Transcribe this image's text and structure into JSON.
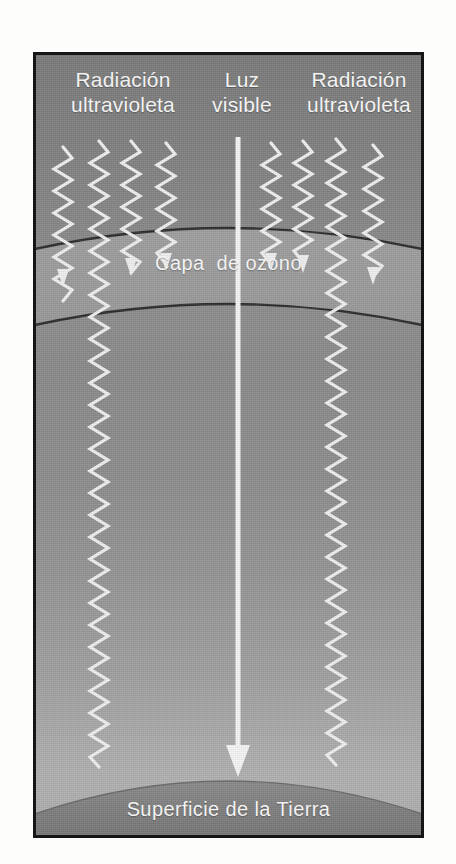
{
  "figure": {
    "language": "es",
    "style": "grayscale halftone print illustration"
  },
  "labels": {
    "uv_left": "Radiación\nultravioleta",
    "visible_light": "Luz\nvisible",
    "uv_right": "Radiación\nultravioleta",
    "ozone_layer": "Capa  de ozono",
    "earth_surface": "Superficie de la Tierra"
  },
  "colors": {
    "frame_border": "#151515",
    "sky_top": "#7a7a7a",
    "sky_mid": "#8a8a8a",
    "sky_lower": "#a8a8a8",
    "ozone_band": "#9a9a9a",
    "ozone_outline": "#2e2e2e",
    "earth_band": "#7d7d7d",
    "ray_white": "#f2f2f2",
    "label_text": "#f2f2f2",
    "page_background": "#fdfdfc"
  },
  "elements": {
    "uv_waves_left": [
      {
        "name": "uv-wave-left-1",
        "x": 27,
        "blocked": true,
        "end_y": 215
      },
      {
        "name": "uv-wave-left-2",
        "x": 63,
        "blocked": false,
        "end_y": 735
      },
      {
        "name": "uv-wave-left-3",
        "x": 95,
        "blocked": true,
        "end_y": 205
      },
      {
        "name": "uv-wave-left-4",
        "x": 130,
        "blocked": true,
        "end_y": 200
      }
    ],
    "uv_waves_right": [
      {
        "name": "uv-wave-right-1",
        "x": 235,
        "blocked": true,
        "end_y": 198
      },
      {
        "name": "uv-wave-right-2",
        "x": 267,
        "blocked": true,
        "end_y": 200
      },
      {
        "name": "uv-wave-right-3",
        "x": 300,
        "blocked": false,
        "end_y": 735
      },
      {
        "name": "uv-wave-right-4",
        "x": 337,
        "blocked": true,
        "end_y": 212
      }
    ],
    "visible_beam": {
      "name": "visible-light-beam",
      "x": 202,
      "start_y": 82,
      "end_y": 718,
      "arrowhead": true,
      "description": "Straight white arrow passing unobstructed through the ozone layer to the Earth's surface"
    },
    "ozone_band": {
      "top_edge_center_y": 162,
      "top_edge_side_y": 196,
      "bottom_edge_center_y": 238,
      "bottom_edge_side_y": 272,
      "description": "Curved lighter band across the figure bounded by two dark arcs"
    },
    "earth_surface": {
      "arc_center_y": 706,
      "arc_side_y": 762,
      "description": "Dark curved band at the bottom representing the Earth's surface"
    }
  },
  "legend_notes": {
    "blocked_count": 6,
    "penetrating_uv_count": 2,
    "meaning": "Most ultraviolet radiation is absorbed by the ozone layer; a small amount reaches the ground along with visible light."
  }
}
